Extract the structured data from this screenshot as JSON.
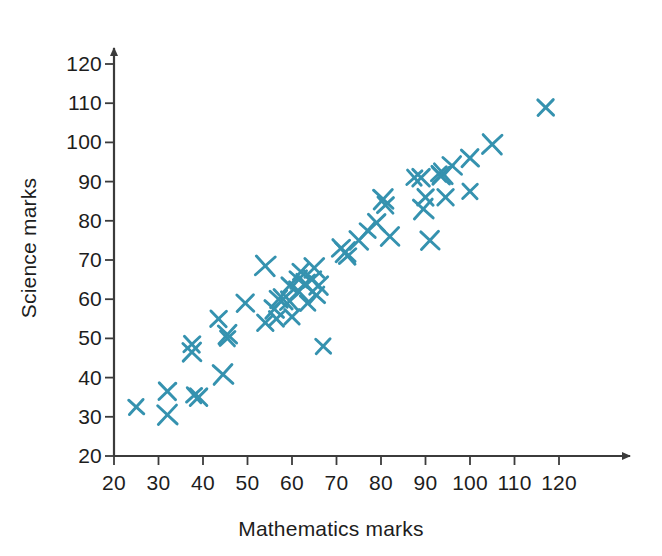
{
  "chart_data": {
    "type": "scatter",
    "title": "",
    "xlabel": "Mathematics marks",
    "ylabel": "Science marks",
    "xlim": [
      20,
      125
    ],
    "ylim": [
      20,
      125
    ],
    "xticks": [
      20,
      30,
      40,
      50,
      60,
      70,
      80,
      90,
      100,
      110,
      120
    ],
    "yticks": [
      20,
      30,
      40,
      50,
      60,
      70,
      80,
      90,
      100,
      110,
      120
    ],
    "grid": false,
    "legend": null,
    "marker": "x",
    "marker_color": "#3592af",
    "series": [
      {
        "name": "Students",
        "points": [
          [
            25,
            32.5
          ],
          [
            32,
            36.5
          ],
          [
            32,
            30.5
          ],
          [
            37.5,
            48.5
          ],
          [
            37.5,
            46.5
          ],
          [
            38,
            35.5
          ],
          [
            39,
            35
          ],
          [
            44.5,
            40.8
          ],
          [
            43.5,
            55
          ],
          [
            45.5,
            51
          ],
          [
            45.5,
            50
          ],
          [
            49.5,
            59
          ],
          [
            54,
            68.5
          ],
          [
            54,
            54
          ],
          [
            56,
            57.5
          ],
          [
            56.5,
            55
          ],
          [
            57,
            60
          ],
          [
            58,
            60
          ],
          [
            59.5,
            63.5
          ],
          [
            59.5,
            59.5
          ],
          [
            60,
            55.5
          ],
          [
            61.5,
            65
          ],
          [
            61.5,
            62
          ],
          [
            62,
            67
          ],
          [
            63,
            64
          ],
          [
            63.5,
            59
          ],
          [
            64.5,
            65
          ],
          [
            65,
            68
          ],
          [
            65.5,
            61
          ],
          [
            66,
            63.5
          ],
          [
            67,
            48
          ],
          [
            71,
            73
          ],
          [
            72,
            72
          ],
          [
            72.5,
            71
          ],
          [
            75,
            75
          ],
          [
            77,
            77.5
          ],
          [
            79,
            79.5
          ],
          [
            80.5,
            85.5
          ],
          [
            81,
            84
          ],
          [
            82,
            76
          ],
          [
            87.5,
            91
          ],
          [
            89,
            91
          ],
          [
            89.5,
            83
          ],
          [
            90,
            86
          ],
          [
            91,
            75
          ],
          [
            93,
            92
          ],
          [
            93.5,
            91.5
          ],
          [
            94,
            92
          ],
          [
            94.5,
            86
          ],
          [
            96,
            94
          ],
          [
            100,
            87.5
          ],
          [
            100,
            96
          ],
          [
            105,
            99.5
          ],
          [
            117,
            108.9
          ]
        ]
      }
    ]
  },
  "axis": {
    "x_origin_px": 114,
    "y_origin_px": 456,
    "x_unit_px": 4.45,
    "y_unit_px": 3.92
  }
}
